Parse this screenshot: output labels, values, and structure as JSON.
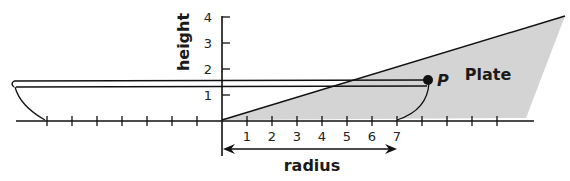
{
  "diagram": {
    "plate_label": "Plate",
    "point_label": "P",
    "y_axis_label": "height",
    "x_axis_label": "radius",
    "y_ticks": [
      "1",
      "2",
      "3",
      "4"
    ],
    "x_ticks": [
      "1",
      "2",
      "3",
      "4",
      "5",
      "6",
      "7"
    ],
    "colors": {
      "plate_fill": "#d4d4d4",
      "line": "#111111",
      "background": "#ffffff"
    }
  }
}
